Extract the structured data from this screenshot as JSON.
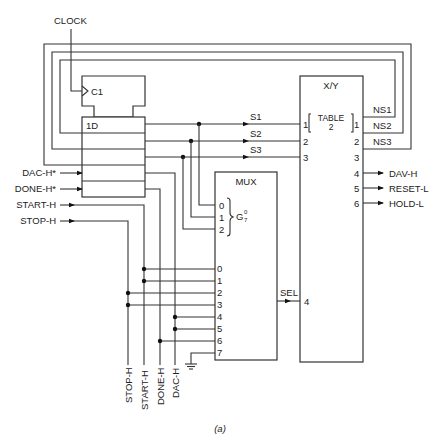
{
  "diagram": {
    "caption": "(a)",
    "clock": {
      "label": "CLOCK",
      "clock_input_label": "C1"
    },
    "register": {
      "label": "1D"
    },
    "register_inputs": [
      "DAC-H*",
      "DONE-H*",
      "START-H",
      "STOP-H"
    ],
    "state_outputs": [
      "S1",
      "S2",
      "S3"
    ],
    "xy_block": {
      "title": "X/Y",
      "table_label_line1": "TABLE",
      "table_label_line2": "2",
      "input_pins": [
        "1",
        "2",
        "3",
        "4"
      ],
      "output_pins": [
        "1",
        "2",
        "3",
        "4",
        "5",
        "6"
      ],
      "next_state_outputs": [
        "NS1",
        "NS2",
        "NS3"
      ],
      "control_outputs": [
        "DAV-H",
        "RESET-L",
        "HOLD-L"
      ]
    },
    "mux": {
      "title": "MUX",
      "select_pins": [
        "0",
        "1",
        "2"
      ],
      "select_label": "G",
      "select_range_top": "0",
      "select_range_bottom": "7",
      "data_pins": [
        "0",
        "1",
        "2",
        "3",
        "4",
        "5",
        "6",
        "7"
      ],
      "output_label": "SEL"
    },
    "bottom_labels": [
      "STOP-H",
      "START-H",
      "DONE-H",
      "DAC-H"
    ]
  }
}
